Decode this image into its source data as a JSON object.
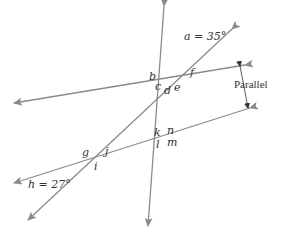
{
  "diagram": {
    "line_color": "#8a8a8a",
    "text_color": "#333333",
    "labels": {
      "a": "a = 35°",
      "b": "b",
      "c": "c",
      "d": "d",
      "e": "e",
      "f": "f",
      "g": "g",
      "h": "h = 27°",
      "i": "i",
      "j": "j",
      "k": "k",
      "l": "l",
      "m": "m",
      "n": "n"
    },
    "parallel_label": "Parallel",
    "given_angles": [
      {
        "name": "a",
        "value_deg": 35
      },
      {
        "name": "h",
        "value_deg": 27
      }
    ]
  }
}
